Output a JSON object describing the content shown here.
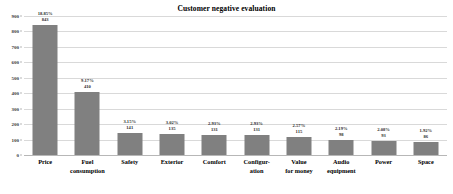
{
  "chart_data": {
    "type": "bar",
    "title": "Customer negative evaluation",
    "xlabel": "",
    "ylabel": "",
    "ylim": [
      0,
      900
    ],
    "ytick_labels": [
      "900",
      "800",
      "700",
      "600",
      "500",
      "400",
      "300",
      "200",
      "100",
      "0"
    ],
    "yticks": [
      900,
      800,
      700,
      600,
      500,
      400,
      300,
      200,
      100,
      0
    ],
    "grid": true,
    "legend": false,
    "bar_color": "#808080",
    "categories": [
      "Price",
      "Fuel\nconsumption",
      "Safety",
      "Exterior",
      "Comfort",
      "Configur-\nation",
      "Value\nfor money",
      "Audio\nequipment",
      "Power",
      "Space"
    ],
    "values": [
      843,
      410,
      141,
      135,
      131,
      131,
      115,
      98,
      93,
      86
    ],
    "value_labels": [
      "843",
      "410",
      "141",
      "135",
      "131",
      "131",
      "115",
      "98",
      "93",
      "86"
    ],
    "percent_labels": [
      "18.85%",
      "9.17%",
      "3.15%",
      "3.02%",
      "2.93%",
      "2.93%",
      "2.57%",
      "2.19%",
      "2.08%",
      "1.92%"
    ],
    "percents": [
      18.85,
      9.17,
      3.15,
      3.02,
      2.93,
      2.93,
      2.57,
      2.19,
      2.08,
      1.92
    ]
  }
}
